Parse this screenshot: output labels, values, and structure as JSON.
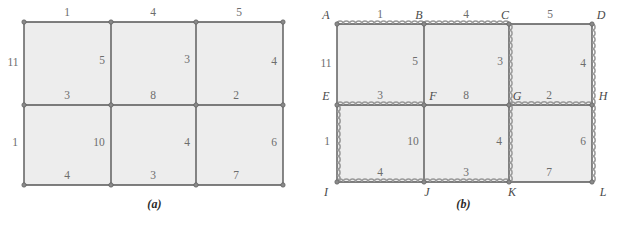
{
  "figure": {
    "panels": [
      {
        "id": "a",
        "caption": "(a)",
        "caption_letter": "a",
        "description": "weighted 3x2 grid graph",
        "geometry": {
          "xs": [
            24,
            111,
            196,
            283
          ],
          "ys": [
            22,
            105,
            185
          ]
        },
        "edges": [
          {
            "name": "top-left",
            "weight": "1",
            "orientation": "horizontal",
            "label_x": 67,
            "label_y": 13,
            "highlighted": false
          },
          {
            "name": "top-middle",
            "weight": "4",
            "orientation": "horizontal",
            "label_x": 153,
            "label_y": 13,
            "highlighted": false
          },
          {
            "name": "top-right",
            "weight": "5",
            "orientation": "horizontal",
            "label_x": 239,
            "label_y": 13,
            "highlighted": false
          },
          {
            "name": "left-outer-upper",
            "weight": "11",
            "orientation": "vertical",
            "label_x": 13,
            "label_y": 63,
            "highlighted": false
          },
          {
            "name": "inner-vert-1-upper",
            "weight": "5",
            "orientation": "vertical",
            "label_x": 102,
            "label_y": 61,
            "highlighted": false
          },
          {
            "name": "inner-vert-2-upper",
            "weight": "3",
            "orientation": "vertical",
            "label_x": 187,
            "label_y": 60,
            "highlighted": false
          },
          {
            "name": "right-outer-upper",
            "weight": "4",
            "orientation": "vertical",
            "label_x": 274,
            "label_y": 62,
            "highlighted": false
          },
          {
            "name": "middle-left",
            "weight": "3",
            "orientation": "horizontal",
            "label_x": 67,
            "label_y": 96,
            "highlighted": false
          },
          {
            "name": "middle-middle",
            "weight": "8",
            "orientation": "horizontal",
            "label_x": 153,
            "label_y": 96,
            "highlighted": false
          },
          {
            "name": "middle-right",
            "weight": "2",
            "orientation": "horizontal",
            "label_x": 236,
            "label_y": 96,
            "highlighted": false
          },
          {
            "name": "left-outer-lower",
            "weight": "1",
            "orientation": "vertical",
            "label_x": 15,
            "label_y": 143,
            "highlighted": false
          },
          {
            "name": "inner-vert-1-lower",
            "weight": "10",
            "orientation": "vertical",
            "label_x": 99,
            "label_y": 143,
            "highlighted": false
          },
          {
            "name": "inner-vert-2-lower",
            "weight": "4",
            "orientation": "vertical",
            "label_x": 187,
            "label_y": 143,
            "highlighted": false
          },
          {
            "name": "right-outer-lower",
            "weight": "6",
            "orientation": "vertical",
            "label_x": 274,
            "label_y": 143,
            "highlighted": false
          },
          {
            "name": "bottom-left",
            "weight": "4",
            "orientation": "horizontal",
            "label_x": 67,
            "label_y": 176,
            "highlighted": false
          },
          {
            "name": "bottom-middle",
            "weight": "3",
            "orientation": "horizontal",
            "label_x": 153,
            "label_y": 176,
            "highlighted": false
          },
          {
            "name": "bottom-right",
            "weight": "7",
            "orientation": "horizontal",
            "label_x": 236,
            "label_y": 176,
            "highlighted": false
          }
        ],
        "vertices": []
      },
      {
        "id": "b",
        "caption": "(b)",
        "caption_letter": "b",
        "description": "same grid graph with spanning tree drawn as wavy edges and lettered vertices",
        "geometry": {
          "xs": [
            28,
            115,
            200,
            283
          ],
          "ys": [
            24,
            105,
            182
          ]
        },
        "edges": [
          {
            "name": "AB",
            "weight": "1",
            "orientation": "horizontal",
            "label_x": 71,
            "label_y": 15,
            "highlighted": true
          },
          {
            "name": "BC",
            "weight": "4",
            "orientation": "horizontal",
            "label_x": 157,
            "label_y": 15,
            "highlighted": true
          },
          {
            "name": "CD",
            "weight": "5",
            "orientation": "horizontal",
            "label_x": 241,
            "label_y": 15,
            "highlighted": false
          },
          {
            "name": "AE",
            "weight": "11",
            "orientation": "vertical",
            "label_x": 17,
            "label_y": 64,
            "highlighted": false
          },
          {
            "name": "BF",
            "weight": "5",
            "orientation": "vertical",
            "label_x": 106,
            "label_y": 62,
            "highlighted": false
          },
          {
            "name": "CG",
            "weight": "3",
            "orientation": "vertical",
            "label_x": 191,
            "label_y": 62,
            "highlighted": true
          },
          {
            "name": "DH",
            "weight": "4",
            "orientation": "vertical",
            "label_x": 274,
            "label_y": 64,
            "highlighted": true
          },
          {
            "name": "EF",
            "weight": "3",
            "orientation": "horizontal",
            "label_x": 71,
            "label_y": 96,
            "highlighted": true
          },
          {
            "name": "FG",
            "weight": "8",
            "orientation": "horizontal",
            "label_x": 157,
            "label_y": 96,
            "highlighted": false
          },
          {
            "name": "GH",
            "weight": "2",
            "orientation": "horizontal",
            "label_x": 240,
            "label_y": 96,
            "highlighted": true
          },
          {
            "name": "EI",
            "weight": "1",
            "orientation": "vertical",
            "label_x": 18,
            "label_y": 142,
            "highlighted": true
          },
          {
            "name": "FJ",
            "weight": "10",
            "orientation": "vertical",
            "label_x": 104,
            "label_y": 142,
            "highlighted": false
          },
          {
            "name": "GK",
            "weight": "4",
            "orientation": "vertical",
            "label_x": 190,
            "label_y": 142,
            "highlighted": true
          },
          {
            "name": "HL",
            "weight": "6",
            "orientation": "vertical",
            "label_x": 274,
            "label_y": 142,
            "highlighted": true
          },
          {
            "name": "IJ",
            "weight": "4",
            "orientation": "horizontal",
            "label_x": 71,
            "label_y": 173,
            "highlighted": true
          },
          {
            "name": "JK",
            "weight": "3",
            "orientation": "horizontal",
            "label_x": 157,
            "label_y": 173,
            "highlighted": true
          },
          {
            "name": "KL",
            "weight": "7",
            "orientation": "horizontal",
            "label_x": 240,
            "label_y": 173,
            "highlighted": false
          }
        ],
        "vertices": [
          {
            "name": "A",
            "label": "A",
            "label_x": 17,
            "label_y": 15
          },
          {
            "name": "B",
            "label": "B",
            "label_x": 110,
            "label_y": 15
          },
          {
            "name": "C",
            "label": "C",
            "label_x": 196,
            "label_y": 15
          },
          {
            "name": "D",
            "label": "D",
            "label_x": 292,
            "label_y": 15
          },
          {
            "name": "E",
            "label": "E",
            "label_x": 17,
            "label_y": 96
          },
          {
            "name": "F",
            "label": "F",
            "label_x": 124,
            "label_y": 96
          },
          {
            "name": "G",
            "label": "G",
            "label_x": 208,
            "label_y": 96
          },
          {
            "name": "H",
            "label": "H",
            "label_x": 294,
            "label_y": 96
          },
          {
            "name": "I",
            "label": "I",
            "label_x": 17,
            "label_y": 192
          },
          {
            "name": "J",
            "label": "J",
            "label_x": 118,
            "label_y": 192
          },
          {
            "name": "K",
            "label": "K",
            "label_x": 203,
            "label_y": 192
          },
          {
            "name": "L",
            "label": "L",
            "label_x": 294,
            "label_y": 192
          }
        ]
      }
    ],
    "colors": {
      "cell_fill": "#ededed",
      "edge_stroke": "#555555",
      "node_fill": "#8a8a8a",
      "highlight_stroke": "#9a9a9a",
      "weight_text": "#6d6d6d",
      "vertex_text": "#4a4a4a",
      "caption_text": "#2b2b2b",
      "background": "#ffffff"
    }
  }
}
